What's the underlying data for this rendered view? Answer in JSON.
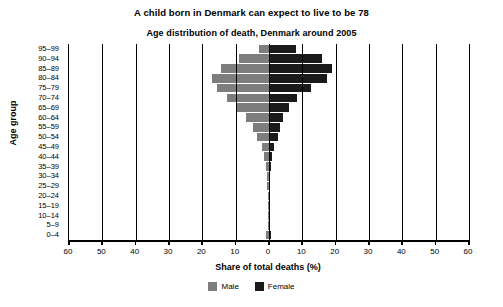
{
  "titles": {
    "main": "A child born in Denmark can expect to live to be 78",
    "sub": "Age distribution of death, Denmark around 2005"
  },
  "axis": {
    "x_title": "Share of total deaths (%)",
    "y_title": "Age group",
    "x_ticks": [
      "60",
      "50",
      "40",
      "30",
      "20",
      "10",
      "0",
      "10",
      "20",
      "30",
      "40",
      "50",
      "60"
    ]
  },
  "legend": {
    "male_label": "Male",
    "female_label": "Female",
    "male_color": "#7d7d7d",
    "female_color": "#1a1a1a"
  },
  "chart_data": {
    "type": "bar",
    "title": "Age distribution of death, Denmark around 2005",
    "subtitle": "A child born in Denmark can expect to live to be 78",
    "xlabel": "Share of total deaths (%)",
    "ylabel": "Age group",
    "xlim": [
      -60,
      60
    ],
    "xtick_values": [
      -60,
      -50,
      -40,
      -30,
      -20,
      -10,
      0,
      10,
      20,
      30,
      40,
      50,
      60
    ],
    "grid": true,
    "legend_position": "bottom",
    "orientation": "population-pyramid",
    "categories": [
      "95–99",
      "90–94",
      "85–89",
      "80–84",
      "75–79",
      "70–74",
      "65–69",
      "60–64",
      "55–59",
      "50–54",
      "45–49",
      "40–44",
      "35–39",
      "30–34",
      "25–29",
      "20–24",
      "15–19",
      "10–14",
      "5–9",
      "0–4"
    ],
    "series": [
      {
        "name": "Male",
        "color": "#7d7d7d",
        "values": [
          3.0,
          9.0,
          14.5,
          17.0,
          15.5,
          12.5,
          10.0,
          7.0,
          4.8,
          3.6,
          2.2,
          1.4,
          0.9,
          0.6,
          0.5,
          0.4,
          0.3,
          0.2,
          0.2,
          0.8
        ]
      },
      {
        "name": "Female",
        "color": "#1a1a1a",
        "values": [
          8.0,
          16.0,
          19.0,
          17.5,
          12.5,
          8.5,
          6.0,
          4.3,
          3.2,
          2.6,
          1.6,
          1.0,
          0.6,
          0.4,
          0.3,
          0.3,
          0.2,
          0.2,
          0.2,
          0.6
        ]
      }
    ]
  }
}
